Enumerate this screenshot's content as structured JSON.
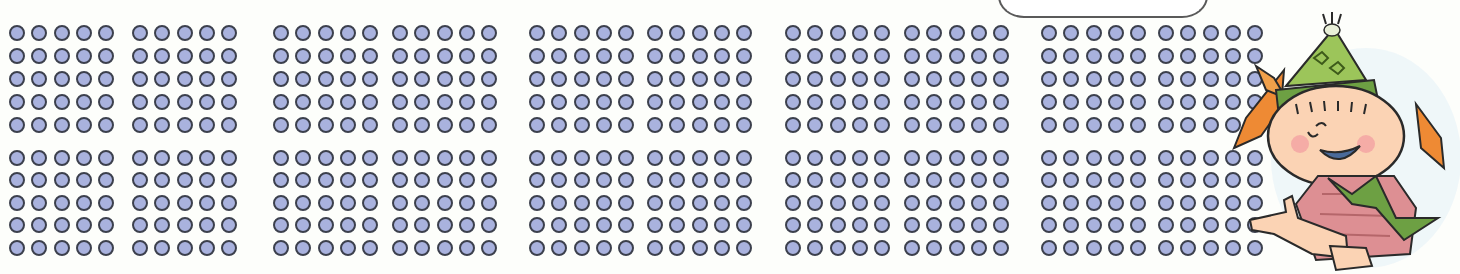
{
  "worksheet": {
    "description": "Dot array counting worksheet: 10 blocks per row band, each block a 5x5 grid of dots, two bands (top and bottom).",
    "speech_bubble": {
      "text": "",
      "visible_fragment": "· · ·   · ·   · · ·"
    },
    "dot_grid": {
      "blocks_per_band": 10,
      "bands": 2,
      "rows_per_block": 5,
      "cols_per_block": 5,
      "dots_total": 500,
      "block_first_dot_x": [
        17,
        140,
        281,
        400,
        537,
        655,
        793,
        912,
        1049,
        1166
      ],
      "dot_pitch_x": 22.3,
      "band_row_y": [
        [
          33,
          56,
          79,
          102,
          125
        ],
        [
          158,
          180,
          203,
          225,
          248
        ]
      ],
      "colors": {
        "fill": "#a9b2de",
        "outline": "#3c404d"
      }
    },
    "character": {
      "name": "pointing-child-with-party-hat",
      "hat_color": "#8bb84a",
      "hair_color": "#e8792a",
      "skin_color": "#f7c9a6",
      "shirt_color": "#d98a8e",
      "scarf_color": "#6da043"
    }
  }
}
